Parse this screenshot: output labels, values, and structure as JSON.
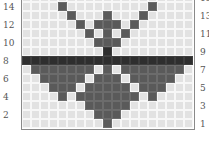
{
  "chart": {
    "type": "knitting-chart",
    "columns": 19,
    "rows_visible": 15,
    "colors": {
      "background": "#e2e2e2",
      "gridline": "#f7f7f7",
      "fill": "#5a5a5a",
      "fill_dark": "#2e2e2e",
      "border": "#8a8a8a"
    },
    "row_labels_left": [
      "2",
      "4",
      "6",
      "8",
      "10",
      "12",
      "14"
    ],
    "row_labels_right": [
      "1",
      "3",
      "5",
      "7",
      "9",
      "11",
      "13",
      "15"
    ],
    "rows": [
      {
        "row": 15,
        "filled": [],
        "dark": []
      },
      {
        "row": 14,
        "filled": [
          4,
          14
        ],
        "dark": []
      },
      {
        "row": 13,
        "filled": [
          5,
          9,
          13
        ],
        "dark": []
      },
      {
        "row": 12,
        "filled": [
          6,
          8,
          9,
          10,
          12
        ],
        "dark": []
      },
      {
        "row": 11,
        "filled": [
          7,
          9,
          11
        ],
        "dark": []
      },
      {
        "row": 10,
        "filled": [
          8,
          9,
          10
        ],
        "dark": []
      },
      {
        "row": 9,
        "filled": [],
        "dark": [
          9
        ]
      },
      {
        "row": 8,
        "filled": [],
        "dark": [
          0,
          1,
          2,
          3,
          4,
          5,
          6,
          7,
          8,
          9,
          10,
          11,
          12,
          13,
          14,
          15,
          16,
          17,
          18
        ]
      },
      {
        "row": 7,
        "filled": [
          1,
          2,
          3,
          4,
          5,
          6,
          7,
          9,
          11,
          12,
          13,
          14,
          15,
          16,
          17
        ],
        "dark": []
      },
      {
        "row": 6,
        "filled": [
          2,
          3,
          4,
          5,
          6,
          8,
          9,
          10,
          12,
          13,
          14,
          15,
          16
        ],
        "dark": []
      },
      {
        "row": 5,
        "filled": [
          3,
          4,
          5,
          7,
          8,
          9,
          10,
          11,
          13,
          14,
          15
        ],
        "dark": []
      },
      {
        "row": 4,
        "filled": [
          4,
          6,
          7,
          8,
          9,
          10,
          11,
          12,
          14
        ],
        "dark": []
      },
      {
        "row": 3,
        "filled": [
          7,
          8,
          9,
          10,
          11
        ],
        "dark": []
      },
      {
        "row": 2,
        "filled": [
          8,
          9,
          10
        ],
        "dark": []
      },
      {
        "row": 1,
        "filled": [
          9
        ],
        "dark": []
      }
    ]
  }
}
